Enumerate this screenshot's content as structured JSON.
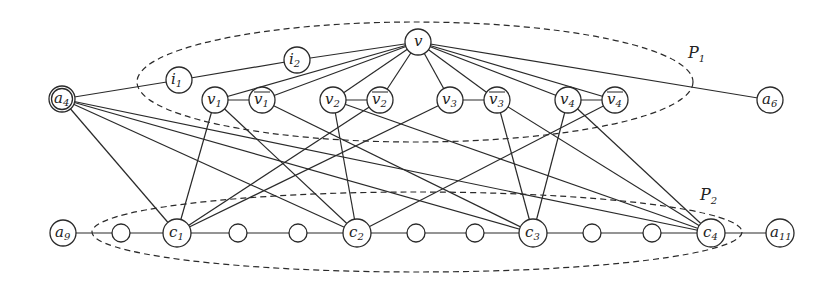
{
  "diagram": {
    "title": "",
    "colors": {
      "stroke": "#2a2a2a",
      "background": "#ffffff",
      "node_fill": "#ffffff"
    },
    "regions": [
      {
        "id": "P1",
        "label": "P",
        "sub": "1",
        "cx": 415,
        "cy": 82,
        "rx": 278,
        "ry": 60,
        "label_x": 688,
        "label_y": 58
      },
      {
        "id": "P2",
        "label": "P",
        "sub": "2",
        "cx": 417,
        "cy": 232,
        "rx": 325,
        "ry": 40,
        "label_x": 700,
        "label_y": 200
      }
    ],
    "nodes": [
      {
        "id": "v",
        "label": "v",
        "sub": "",
        "bar": false,
        "x": 418,
        "y": 42,
        "r": 13
      },
      {
        "id": "i1",
        "label": "i",
        "sub": "1",
        "bar": false,
        "x": 179,
        "y": 80,
        "r": 13
      },
      {
        "id": "i2",
        "label": "i",
        "sub": "2",
        "bar": false,
        "x": 297,
        "y": 60,
        "r": 13
      },
      {
        "id": "a4",
        "label": "a",
        "sub": "4",
        "bar": false,
        "x": 62,
        "y": 99,
        "r": 13,
        "double": true
      },
      {
        "id": "v1",
        "label": "v",
        "sub": "1",
        "bar": false,
        "x": 215,
        "y": 100,
        "r": 13
      },
      {
        "id": "nv1",
        "label": "v",
        "sub": "1",
        "bar": true,
        "x": 262,
        "y": 100,
        "r": 13
      },
      {
        "id": "v2",
        "label": "v",
        "sub": "2",
        "bar": false,
        "x": 333,
        "y": 100,
        "r": 13
      },
      {
        "id": "nv2",
        "label": "v",
        "sub": "2",
        "bar": true,
        "x": 380,
        "y": 100,
        "r": 13
      },
      {
        "id": "v3",
        "label": "v",
        "sub": "3",
        "bar": false,
        "x": 450,
        "y": 100,
        "r": 13
      },
      {
        "id": "nv3",
        "label": "v",
        "sub": "3",
        "bar": true,
        "x": 497,
        "y": 100,
        "r": 13
      },
      {
        "id": "v4",
        "label": "v",
        "sub": "4",
        "bar": false,
        "x": 568,
        "y": 100,
        "r": 13
      },
      {
        "id": "nv4",
        "label": "v",
        "sub": "4",
        "bar": true,
        "x": 615,
        "y": 100,
        "r": 13
      },
      {
        "id": "a6",
        "label": "a",
        "sub": "6",
        "bar": false,
        "x": 770,
        "y": 100,
        "r": 13
      },
      {
        "id": "a9",
        "label": "a",
        "sub": "9",
        "bar": false,
        "x": 63,
        "y": 233,
        "r": 13
      },
      {
        "id": "s1",
        "label": "",
        "sub": "",
        "bar": false,
        "x": 121,
        "y": 233,
        "r": 9
      },
      {
        "id": "c1",
        "label": "c",
        "sub": "1",
        "bar": false,
        "x": 177,
        "y": 233,
        "r": 14
      },
      {
        "id": "s2",
        "label": "",
        "sub": "",
        "bar": false,
        "x": 238,
        "y": 233,
        "r": 9
      },
      {
        "id": "s3",
        "label": "",
        "sub": "",
        "bar": false,
        "x": 298,
        "y": 233,
        "r": 9
      },
      {
        "id": "c2",
        "label": "c",
        "sub": "2",
        "bar": false,
        "x": 357,
        "y": 233,
        "r": 14
      },
      {
        "id": "s4",
        "label": "",
        "sub": "",
        "bar": false,
        "x": 416,
        "y": 233,
        "r": 9
      },
      {
        "id": "s5",
        "label": "",
        "sub": "",
        "bar": false,
        "x": 475,
        "y": 233,
        "r": 9
      },
      {
        "id": "c3",
        "label": "c",
        "sub": "3",
        "bar": false,
        "x": 533,
        "y": 233,
        "r": 14
      },
      {
        "id": "s6",
        "label": "",
        "sub": "",
        "bar": false,
        "x": 592,
        "y": 233,
        "r": 9
      },
      {
        "id": "s7",
        "label": "",
        "sub": "",
        "bar": false,
        "x": 652,
        "y": 233,
        "r": 9
      },
      {
        "id": "c4",
        "label": "c",
        "sub": "4",
        "bar": false,
        "x": 711,
        "y": 233,
        "r": 14
      },
      {
        "id": "a11",
        "label": "a",
        "sub": "11",
        "bar": false,
        "x": 780,
        "y": 233,
        "r": 14
      }
    ],
    "edges": [
      [
        "a4",
        "i1"
      ],
      [
        "i1",
        "i2"
      ],
      [
        "i2",
        "v"
      ],
      [
        "v",
        "v1"
      ],
      [
        "v",
        "nv1"
      ],
      [
        "v",
        "v2"
      ],
      [
        "v",
        "nv2"
      ],
      [
        "v",
        "v3"
      ],
      [
        "v",
        "nv3"
      ],
      [
        "v",
        "v4"
      ],
      [
        "v",
        "nv4"
      ],
      [
        "v",
        "a6"
      ],
      [
        "v1",
        "nv1"
      ],
      [
        "v2",
        "nv2"
      ],
      [
        "v3",
        "nv3"
      ],
      [
        "v4",
        "nv4"
      ],
      [
        "a4",
        "c1"
      ],
      [
        "a4",
        "c2"
      ],
      [
        "a4",
        "c3"
      ],
      [
        "a4",
        "c4"
      ],
      [
        "v1",
        "c1"
      ],
      [
        "v1",
        "c2"
      ],
      [
        "nv1",
        "c3"
      ],
      [
        "v2",
        "c2"
      ],
      [
        "v2",
        "c4"
      ],
      [
        "nv2",
        "c1"
      ],
      [
        "v3",
        "c1"
      ],
      [
        "nv3",
        "c3"
      ],
      [
        "nv3",
        "c4"
      ],
      [
        "v4",
        "c3"
      ],
      [
        "v4",
        "c4"
      ],
      [
        "nv4",
        "c2"
      ],
      [
        "a9",
        "s1"
      ],
      [
        "s1",
        "c1"
      ],
      [
        "c1",
        "s2"
      ],
      [
        "s2",
        "s3"
      ],
      [
        "s3",
        "c2"
      ],
      [
        "c2",
        "s4"
      ],
      [
        "s4",
        "s5"
      ],
      [
        "s5",
        "c3"
      ],
      [
        "c3",
        "s6"
      ],
      [
        "s6",
        "s7"
      ],
      [
        "s7",
        "c4"
      ],
      [
        "c4",
        "a11"
      ]
    ]
  }
}
